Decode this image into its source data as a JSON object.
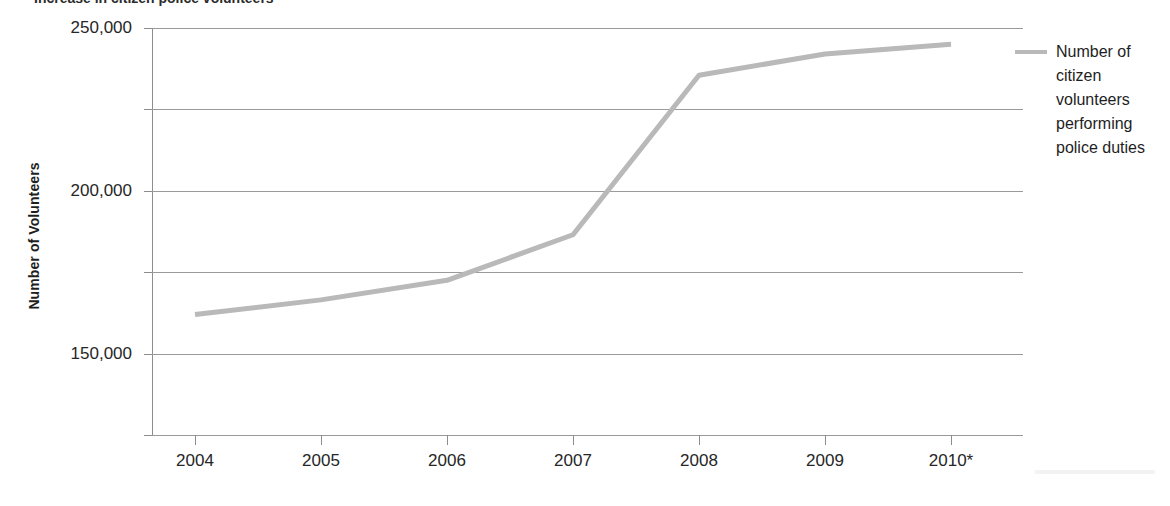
{
  "figure": {
    "title_cropped": "Increase in citizen police volunteers",
    "y_axis_label": "Number of Volunteers",
    "legend_label": "Number of citizen volunteers performing police duties",
    "legend_swatch_name": "series-line-swatch",
    "series_color": "#b9b9b9",
    "grid_color": "#9a9a9a",
    "footnote_marker": "*"
  },
  "chart_data": {
    "type": "line",
    "title": "Increase in citizen police volunteers",
    "xlabel": "",
    "ylabel": "Number of Volunteers",
    "categories": [
      "2004",
      "2005",
      "2006",
      "2007",
      "2008",
      "2009",
      "2010*"
    ],
    "series": [
      {
        "name": "Number of citizen volunteers performing police duties",
        "color": "#b9b9b9",
        "values": [
          74000,
          83000,
          95000,
          123000,
          221000,
          234000,
          240000
        ]
      }
    ],
    "ylim": [
      0,
      250000
    ],
    "yticks": [
      0,
      50000,
      100000,
      150000,
      200000,
      250000
    ],
    "ytick_labels": [
      "0",
      "50,000",
      "100,000",
      "150,000",
      "200,000",
      "250,000"
    ],
    "grid": true,
    "grid_axis": "y",
    "legend_position": "right"
  }
}
